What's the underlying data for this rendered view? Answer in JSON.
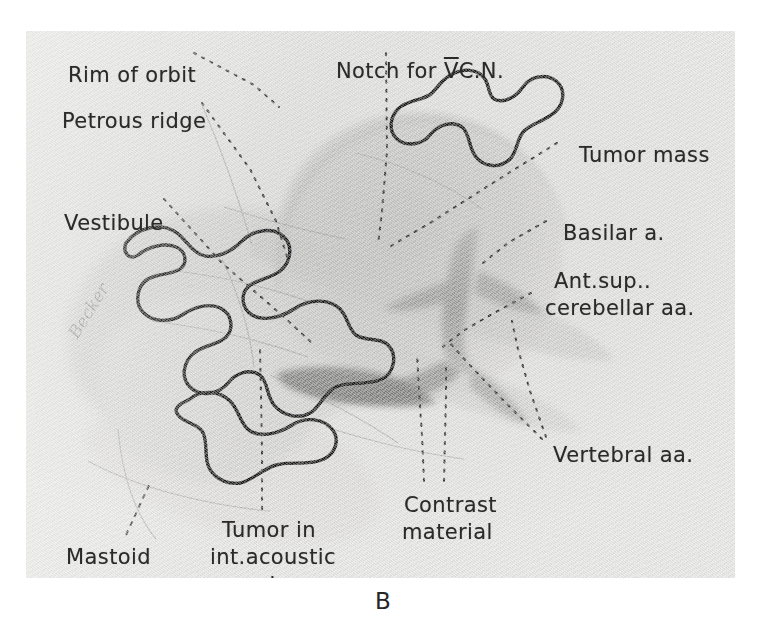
{
  "figure": {
    "caption": "B",
    "signature": "Becker",
    "plate_background": "#e4e4e2",
    "ink_color": "#2a2a2a",
    "outline_color": "#1d1d1d"
  },
  "labels": [
    {
      "id": "rim-of-orbit",
      "text": "Rim of orbit",
      "x": 42,
      "y": 32
    },
    {
      "id": "petrous-ridge",
      "text": "Petrous ridge",
      "x": 36,
      "y": 78
    },
    {
      "id": "vestibule",
      "text": "Vestibule",
      "x": 38,
      "y": 180
    },
    {
      "id": "notch-for-v-cn",
      "text": "Notch for ",
      "x": 310,
      "y": 28,
      "suffix_overline": "V",
      "suffix_tail": "C.N."
    },
    {
      "id": "tumor-mass",
      "text": "Tumor mass",
      "x": 553,
      "y": 112
    },
    {
      "id": "basilar-artery",
      "text": "Basilar a.",
      "x": 537,
      "y": 190
    },
    {
      "id": "ant-sup-cerebellar-1",
      "text": "Ant.sup..",
      "x": 528,
      "y": 238
    },
    {
      "id": "ant-sup-cerebellar-2",
      "text": "cerebellar aa.",
      "x": 519,
      "y": 265
    },
    {
      "id": "vertebral-arteries",
      "text": "Vertebral aa.",
      "x": 527,
      "y": 412
    },
    {
      "id": "contrast-material-1",
      "text": "Contrast",
      "x": 378,
      "y": 462
    },
    {
      "id": "contrast-material-2",
      "text": "material",
      "x": 376,
      "y": 489
    },
    {
      "id": "tumor-in-iam-1",
      "text": "Tumor in",
      "x": 196,
      "y": 487
    },
    {
      "id": "tumor-in-iam-2",
      "text": "int.acoustic",
      "x": 184,
      "y": 514
    },
    {
      "id": "tumor-in-iam-3",
      "text": "meatus",
      "x": 196,
      "y": 541
    },
    {
      "id": "mastoid-process-1",
      "text": "Mastoid",
      "x": 40,
      "y": 514
    },
    {
      "id": "mastoid-process-2",
      "text": "process",
      "x": 36,
      "y": 541
    }
  ],
  "leader_lines": [
    {
      "id": "leader-rim-of-orbit",
      "points": "168,22 228,54 253,76"
    },
    {
      "id": "leader-petrous-ridge",
      "points": "176,72 224,138 250,190 262,229"
    },
    {
      "id": "leader-vestibule",
      "points": "138,168 196,232 258,286 285,311"
    },
    {
      "id": "leader-notch-for-v-cn",
      "points": "360,22 361,120 356,180 352,214"
    },
    {
      "id": "leader-tumor-mass",
      "points": "531,112 470,150 404,192 360,218"
    },
    {
      "id": "leader-basilar-artery",
      "points": "520,190 482,212 452,236"
    },
    {
      "id": "leader-ant-sup-cerebellar",
      "points": "505,262 468,282 437,300 414,318"
    },
    {
      "id": "leader-vertebral-a-left",
      "points": "516,408 476,368 440,330 424,312"
    },
    {
      "id": "leader-vertebral-a-right",
      "points": "520,406 504,360 492,318 486,290"
    },
    {
      "id": "leader-contrast-left",
      "points": "398,450 396,404 393,360 391,322"
    },
    {
      "id": "leader-contrast-right",
      "points": "418,450 419,406 420,366 420,336"
    },
    {
      "id": "leader-tumor-in-iam",
      "points": "236,478 236,420 235,364 234,318"
    },
    {
      "id": "leader-mastoid-process",
      "points": "100,504 112,478 124,452"
    }
  ],
  "anatomy": {
    "tumor_outline_color": "#1d1d1d",
    "bone_fill_light": "#dcdcda",
    "bone_fill_mid": "#cfcfcd",
    "bone_fill_dark": "#bdbdbb",
    "vessel_fill": "#a9a9a7",
    "vessel_fill_dark": "#8e8e8c"
  }
}
